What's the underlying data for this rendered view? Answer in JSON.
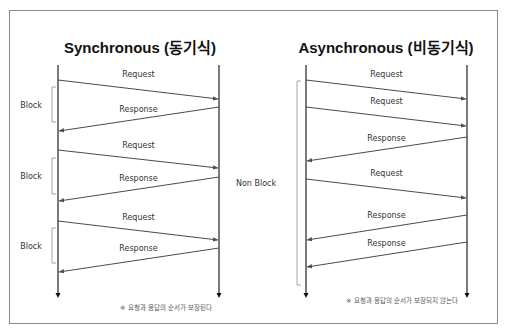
{
  "colors": {
    "line": "#4a4a4a",
    "bracket": "#9a9a9a",
    "border": "#8a8a8a"
  },
  "panels": [
    {
      "id": "sync",
      "title": "Synchronous (동기식)",
      "title_x": 140,
      "title_y": 53,
      "left_x": 58,
      "right_x": 219,
      "top_y": 65,
      "bottom_y": 298,
      "messages": [
        {
          "label": "Request",
          "dir": "right",
          "y1": 80,
          "y2": 99,
          "label_y": 77
        },
        {
          "label": "Response",
          "dir": "left",
          "y1": 107,
          "y2": 131,
          "label_y": 112
        },
        {
          "label": "Request",
          "dir": "right",
          "y1": 150,
          "y2": 168,
          "label_y": 148
        },
        {
          "label": "Response",
          "dir": "left",
          "y1": 177,
          "y2": 201,
          "label_y": 181
        },
        {
          "label": "Request",
          "dir": "right",
          "y1": 221,
          "y2": 240,
          "label_y": 220
        },
        {
          "label": "Response",
          "dir": "left",
          "y1": 248,
          "y2": 272,
          "label_y": 251
        }
      ],
      "brackets": [
        {
          "label": "Block",
          "y1": 87,
          "y2": 122,
          "x": 52,
          "label_x": 31
        },
        {
          "label": "Block",
          "y1": 158,
          "y2": 194,
          "x": 52,
          "label_x": 31
        },
        {
          "label": "Block",
          "y1": 228,
          "y2": 263,
          "x": 52,
          "label_x": 31
        }
      ],
      "note": "※ 요청과 응답의 순서가 보장된다",
      "note_x": 120,
      "note_y": 310
    },
    {
      "id": "async",
      "title": "Asynchronous (비동기식)",
      "title_x": 386,
      "title_y": 53,
      "left_x": 306,
      "right_x": 467,
      "top_y": 65,
      "bottom_y": 298,
      "messages": [
        {
          "label": "Request",
          "dir": "right",
          "y1": 80,
          "y2": 99,
          "label_y": 77
        },
        {
          "label": "Request",
          "dir": "right",
          "y1": 107,
          "y2": 126,
          "label_y": 104
        },
        {
          "label": "Response",
          "dir": "left",
          "y1": 137,
          "y2": 161,
          "label_y": 141
        },
        {
          "label": "Request",
          "dir": "right",
          "y1": 179,
          "y2": 198,
          "label_y": 176
        },
        {
          "label": "Response",
          "dir": "left",
          "y1": 215,
          "y2": 240,
          "label_y": 218
        },
        {
          "label": "Response",
          "dir": "left",
          "y1": 242,
          "y2": 267,
          "label_y": 246
        }
      ],
      "brackets": [
        {
          "label": "Non Block",
          "y1": 81,
          "y2": 285,
          "x": 297,
          "label_x": 256
        }
      ],
      "note": "※ 요청과 응답의 순서가 보장되지 않는다",
      "note_x": 346,
      "note_y": 303
    }
  ]
}
